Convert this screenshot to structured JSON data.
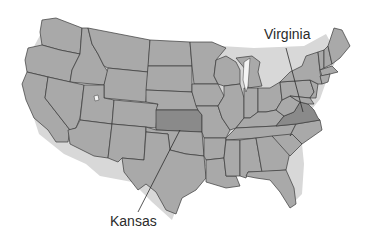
{
  "map": {
    "title": "United States",
    "base_color": "#a9a9a9",
    "highlight_color": "#8a8a8a",
    "border_color": "#3a3a3a",
    "highlighted_states": [
      "Kansas",
      "Virginia"
    ]
  },
  "labels": {
    "virginia": "Virginia",
    "kansas": "Kansas"
  }
}
